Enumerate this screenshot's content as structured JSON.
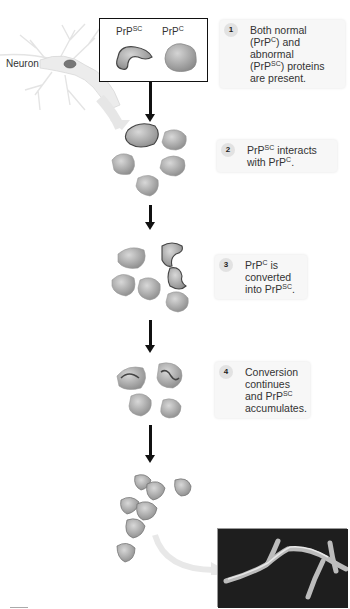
{
  "figure": {
    "type": "prion-conversion-diagram",
    "neuron_label": "Neuron",
    "top_box": {
      "labels": [
        {
          "base": "PrP",
          "sup": "SC"
        },
        {
          "base": "PrP",
          "sup": "C"
        }
      ]
    },
    "steps": [
      {
        "number": "1",
        "lines": [
          {
            "text": "Both normal"
          },
          {
            "pre": "(PrP",
            "sup": "C",
            "post": ") and"
          },
          {
            "text": "abnormal"
          },
          {
            "pre": "(PrP",
            "sup": "SC",
            "post": ") proteins"
          },
          {
            "text": "are present."
          }
        ]
      },
      {
        "number": "2",
        "lines": [
          {
            "pre": "PrP",
            "sup": "SC",
            "post": " interacts"
          },
          {
            "pre": "with PrP",
            "sup": "C",
            "post": "."
          }
        ]
      },
      {
        "number": "3",
        "lines": [
          {
            "pre": "PrP",
            "sup": "C",
            "post": " is"
          },
          {
            "text": "converted"
          },
          {
            "pre": "into PrP",
            "sup": "SC",
            "post": "."
          }
        ]
      },
      {
        "number": "4",
        "lines": [
          {
            "text": "Conversion"
          },
          {
            "text": "continues"
          },
          {
            "pre": "and PrP",
            "sup": "SC",
            "post": ""
          },
          {
            "text": "accumulates."
          }
        ]
      }
    ],
    "colors": {
      "protein_fill": "#a8a8a8",
      "protein_dark": "#555555",
      "arrow": "#111111",
      "callout_bg": "#f7f7f7",
      "curved_arrow": "#e6e6e6",
      "micrograph_bg": "#1b1b1b"
    }
  }
}
